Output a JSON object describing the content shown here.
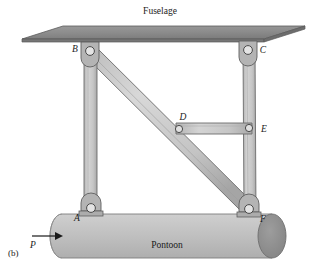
{
  "figure": {
    "caption": "(b)",
    "fuselage_label": "Fuselage",
    "pontoon_label": "Pontoon",
    "force_label": "P",
    "joints": [
      {
        "id": "A",
        "label": "A",
        "x": 91,
        "y": 211,
        "label_x": 79,
        "label_y": 220
      },
      {
        "id": "B",
        "label": "B",
        "x": 90,
        "y": 51,
        "label_x": 75,
        "label_y": 52
      },
      {
        "id": "C",
        "label": "C",
        "x": 248,
        "y": 50,
        "label_x": 262,
        "label_y": 52
      },
      {
        "id": "D",
        "label": "D",
        "x": 179,
        "y": 129,
        "label_x": 182,
        "label_y": 119
      },
      {
        "id": "E",
        "label": "E",
        "x": 249,
        "y": 128,
        "label_x": 263,
        "label_y": 131
      },
      {
        "id": "F",
        "label": "F",
        "x": 249,
        "y": 212,
        "label_x": 262,
        "label_y": 221
      }
    ],
    "members": [
      {
        "name": "left-column",
        "from": "B",
        "to": "A"
      },
      {
        "name": "right-column",
        "from": "C",
        "to": "F"
      },
      {
        "name": "diagonal-brace",
        "from": "B",
        "to": "F"
      },
      {
        "name": "horizontal-strut",
        "from": "D",
        "to": "E"
      }
    ],
    "colors": {
      "fuselage_fill": "#8e8e8e",
      "fuselage_edge": "#5a5a5a",
      "member_fill": "#c2c2c2",
      "member_edge": "#6b6b6b",
      "bracket_fill": "#b0b0b0",
      "pontoon_fill": "#bdbdbd",
      "pontoon_cap": "#8c8c8c",
      "pin_fill": "#e8e8e8",
      "outline": "#4a4a4a",
      "text": "#1a1a1a"
    }
  }
}
